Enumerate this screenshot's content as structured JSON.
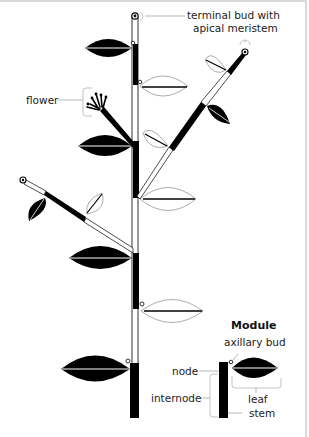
{
  "diagram": {
    "labels": {
      "terminal_bud_line1": "terminal bud with",
      "terminal_bud_line2": "apical meristem",
      "flower": "flower"
    },
    "module": {
      "title": "Module",
      "axillary_bud": "axillary bud",
      "node": "node",
      "internode": "internode",
      "leaf": "leaf",
      "stem": "stem"
    },
    "colors": {
      "ink": "#000000",
      "outline": "#888888",
      "leader": "#999999",
      "frame": "#d9d9d9",
      "background": "#ffffff"
    }
  }
}
